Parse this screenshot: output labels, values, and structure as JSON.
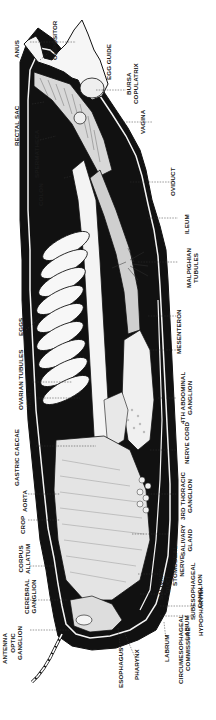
{
  "diagram": {
    "orientation": "head at bottom, abdomen tip at top; labels rotated 90 degrees",
    "colors": {
      "ink": "#1a1a1a",
      "background": "#ffffff",
      "body_fill": "#111111",
      "organ_fill": "#f2f2f2"
    },
    "labels": {
      "anus": "ANUS",
      "ovipositor": "OVIPOSITOR",
      "egg_guide": "EGG GUIDE",
      "bursa_copulatrix": "BURSA\nCOPULATRIX",
      "rectal_sac": "RECTAL SAC",
      "spermatheca": "SPERMATHECA",
      "vagina": "VAGINA",
      "colon": "COLON",
      "oviduct": "OVIDUCT",
      "ileum": "ILEUM",
      "malpighian_tubules": "MALPIGHIAN\nTUBULES",
      "eggs": "EGGS",
      "mesenteron": "MESENTERON",
      "ovarian_tubules": "OVARIAN TUBULES",
      "heart": "HEART",
      "fourth_abdominal_ganglion": "4TH ABDOMINAL\nGANGLION",
      "nerve_cord": "NERVE CORD",
      "gastric_caecae": "GASTRIC CAECAE",
      "third_thoracic_ganglion": "3RD THORACIC\nGANGLION",
      "aorta": "AORTA",
      "crop": "CROP",
      "salivary_gland": "SALIVARY\nGLAND",
      "corpus_allatum": "CORPUS\nALLATUM",
      "stomodeal_nerve": "STOMODEAL\nNERVE",
      "cerebral_ganglion": "CEREBRAL\nGANGLION",
      "salivary_duct": "SALIVARY\nDUCT",
      "subesophageal_ganglion": "SUBESOPHAGEAL\nGANGLION",
      "antenna": "ANTENNA",
      "optic_ganglion": "OPTIC\nGANGLION",
      "labium": "LABIUM",
      "hypopharynx": "HYPOPHARYNX",
      "esophagus": "ESOPHAGUS",
      "pharynx": "PHARYNX",
      "labrum": "LABRUM",
      "circumesophageal_commissure": "CIRCUMESOPHAGEAL\nCOMMISSURE"
    }
  }
}
